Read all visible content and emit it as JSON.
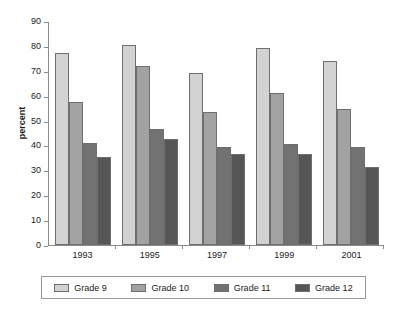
{
  "chart_data": {
    "type": "bar",
    "title": "",
    "xlabel": "",
    "ylabel": "percent",
    "ylim": [
      0,
      90
    ],
    "ytick_step": 10,
    "yticks": [
      "90",
      "80",
      "70",
      "60",
      "50",
      "40",
      "30",
      "20",
      "10",
      "0"
    ],
    "grid": false,
    "legend_position": "bottom",
    "categories": [
      "1993",
      "1995",
      "1997",
      "1999",
      "2001"
    ],
    "series": [
      {
        "name": "Grade 9",
        "color": "#d2d2d2",
        "values": [
          77,
          80.5,
          69,
          79,
          74
        ]
      },
      {
        "name": "Grade 10",
        "color": "#a2a2a2",
        "values": [
          57.5,
          72,
          53.5,
          61,
          54.5
        ]
      },
      {
        "name": "Grade 11",
        "color": "#727272",
        "values": [
          41,
          46.5,
          39.5,
          40.5,
          39.5
        ]
      },
      {
        "name": "Grade 12",
        "color": "#565656",
        "values": [
          35.5,
          42.5,
          36.5,
          36.5,
          31.5
        ]
      }
    ]
  },
  "axis": {
    "y_title": "percent"
  },
  "colors": {
    "axis_line": "#8a8a8a",
    "bar_border": "#6e6e6e",
    "legend_border": "#9a9a9a",
    "text": "#1a1a1a",
    "background": "#ffffff"
  }
}
